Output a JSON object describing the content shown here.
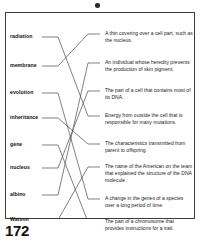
{
  "page": {
    "number": "172",
    "artifact": "scan-speck"
  },
  "worksheet": {
    "terms": [
      {
        "id": "radiation",
        "label": "radiation",
        "y": 20,
        "stub_y": 24
      },
      {
        "id": "membrane",
        "label": "membrane",
        "y": 49,
        "stub_y": 53
      },
      {
        "id": "evolution",
        "label": "evolution",
        "y": 76,
        "stub_y": 80
      },
      {
        "id": "inheritance",
        "label": "inheritance",
        "y": 101,
        "stub_y": 105
      },
      {
        "id": "gene",
        "label": "gene",
        "y": 128,
        "stub_y": 132
      },
      {
        "id": "nucleus",
        "label": "nucleus",
        "y": 151,
        "stub_y": 155
      },
      {
        "id": "albino",
        "label": "albino",
        "y": 178,
        "stub_y": 182
      },
      {
        "id": "watson",
        "label": "Watson",
        "y": 203,
        "stub_y": 207
      }
    ],
    "definitions": [
      {
        "id": "def-membrane",
        "text": "A thin covering over a cell part, such as the nucleus.",
        "y": 17,
        "stub_y": 21
      },
      {
        "id": "def-albino",
        "text": "An individual whose heredity prevents the production of skin pigment.",
        "y": 46,
        "stub_y": 50
      },
      {
        "id": "def-nucleus",
        "text": "The part of a cell that contains most of its DNA.",
        "y": 74,
        "stub_y": 78
      },
      {
        "id": "def-radiation",
        "text": "Energy from outside the cell that is responsible for many mutations.",
        "y": 99,
        "stub_y": 103
      },
      {
        "id": "def-inheritance",
        "text": "The characteristics transmitted from parent to offspring.",
        "y": 127,
        "stub_y": 131
      },
      {
        "id": "def-watson",
        "text": "The name of the American on the team that explained the structure of the DNA molecule.",
        "y": 150,
        "stub_y": 154
      },
      {
        "id": "def-evolution",
        "text": "A change in the genes of a species over a long period of time.",
        "y": 182,
        "stub_y": 186
      },
      {
        "id": "def-gene",
        "text": "The part of a chromosome that provides instructions for a trait.",
        "y": 205,
        "stub_y": 209
      }
    ],
    "connections": [
      {
        "from": "radiation",
        "to": "def-radiation"
      },
      {
        "from": "membrane",
        "to": "def-membrane"
      },
      {
        "from": "evolution",
        "to": "def-evolution"
      },
      {
        "from": "inheritance",
        "to": "def-inheritance"
      },
      {
        "from": "gene",
        "to": "def-gene"
      },
      {
        "from": "nucleus",
        "to": "def-nucleus"
      },
      {
        "from": "albino",
        "to": "def-albino"
      },
      {
        "from": "watson",
        "to": "def-watson"
      }
    ]
  },
  "colors": {
    "ink": "#1a1a1a",
    "rule": "#4a4a4a",
    "border": "#3a3a3a",
    "paper": "#ffffff"
  }
}
